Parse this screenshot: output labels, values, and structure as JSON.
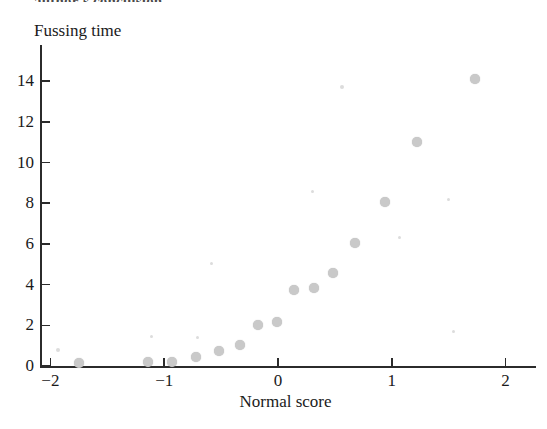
{
  "cropped_heading": "author's conclusion.",
  "chart_data": {
    "type": "scatter",
    "title": "",
    "xlabel": "Normal score",
    "ylabel": "Fussing time",
    "xlim": [
      -2.35,
      2.25
    ],
    "ylim": [
      -0.45,
      15.4
    ],
    "xticks": [
      -2,
      -1,
      0,
      1,
      2
    ],
    "xticklabels": [
      "−2",
      "−1",
      "0",
      "1",
      "2"
    ],
    "yticks": [
      0,
      2,
      4,
      6,
      8,
      10,
      12,
      14
    ],
    "yticklabels": [
      "0",
      "2",
      "4",
      "6",
      "8",
      "10",
      "12",
      "14"
    ],
    "grid": false,
    "legend": null,
    "marker": {
      "shape": "circle",
      "color": "#c9c9c9",
      "size_px": 10
    },
    "points": [
      {
        "x": -1.75,
        "y": 0.15
      },
      {
        "x": -1.14,
        "y": 0.2
      },
      {
        "x": -0.93,
        "y": 0.2
      },
      {
        "x": -0.72,
        "y": 0.45
      },
      {
        "x": -0.52,
        "y": 0.75
      },
      {
        "x": -0.33,
        "y": 1.05
      },
      {
        "x": -0.18,
        "y": 2.0
      },
      {
        "x": -0.01,
        "y": 2.15
      },
      {
        "x": 0.14,
        "y": 3.75
      },
      {
        "x": 0.32,
        "y": 3.85
      },
      {
        "x": 0.48,
        "y": 4.55
      },
      {
        "x": 0.68,
        "y": 6.05
      },
      {
        "x": 0.94,
        "y": 8.05
      },
      {
        "x": 1.22,
        "y": 11.0
      },
      {
        "x": 1.73,
        "y": 14.1
      }
    ]
  }
}
